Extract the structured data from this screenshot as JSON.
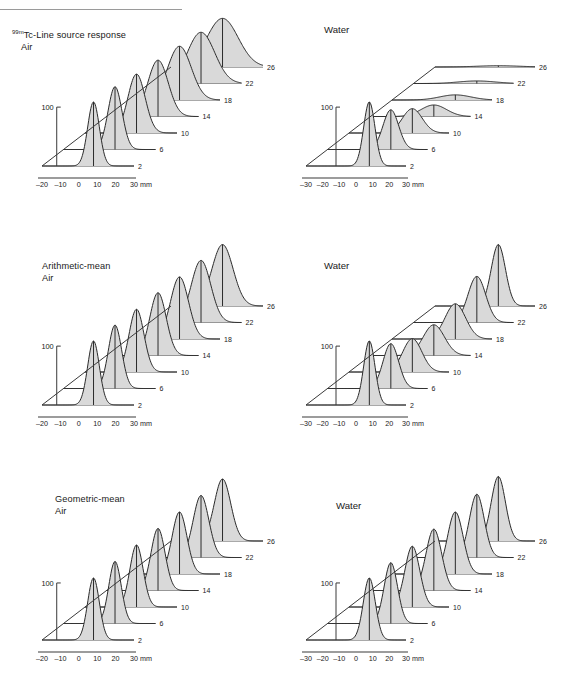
{
  "figure": {
    "title_main": "Tc-Line source response",
    "title_sup": "99m",
    "rows": [
      {
        "id": "row1",
        "label_line1": "Tc-Line source response",
        "label_line2": "Air",
        "has_sup": true
      },
      {
        "id": "row2",
        "label_line1": "Arithmetic-mean",
        "label_line2": "Air",
        "has_sup": false
      },
      {
        "id": "row3",
        "label_line1": "Geometric-mean",
        "label_line2": "Air",
        "has_sup": false
      }
    ],
    "right_column_title": "Water",
    "y_axis_label": "100",
    "x_unit": "mm",
    "x_ticks_air": [
      "-20",
      "-10",
      "0",
      "10",
      "20",
      "30"
    ],
    "x_ticks_water": [
      "-30",
      "-20",
      "-10",
      "0",
      "10",
      "20",
      "30"
    ],
    "depth_labels": [
      "2",
      "6",
      "10",
      "14",
      "18",
      "22",
      "26"
    ],
    "colors": {
      "fill": "#d9d9d9",
      "stroke": "#2b2b2b",
      "axis": "#3a3a3a",
      "rule": "#9a9a9a",
      "baseline": "#555555"
    }
  },
  "chart_data": {
    "type": "line",
    "title": "99mTc-Line source response",
    "xlabel": "mm",
    "ylabel": "100",
    "x": [
      -30,
      -20,
      -10,
      0,
      10,
      20,
      30
    ],
    "xlim_air": [
      -20,
      30
    ],
    "xlim_water": [
      -30,
      30
    ],
    "grid": false,
    "legend": "none",
    "depth_axis_label": "Depth (cm)",
    "depths": [
      2,
      6,
      10,
      14,
      18,
      22,
      26
    ],
    "panels": [
      {
        "row": "99mTc-Line source response",
        "medium": "Air",
        "series": [
          {
            "name": "2",
            "peak": 100,
            "fwhm": 7.5
          },
          {
            "name": "6",
            "peak": 98,
            "fwhm": 9.0
          },
          {
            "name": "10",
            "peak": 92,
            "fwhm": 11.0
          },
          {
            "name": "14",
            "peak": 88,
            "fwhm": 13.0
          },
          {
            "name": "18",
            "peak": 84,
            "fwhm": 15.0
          },
          {
            "name": "22",
            "peak": 80,
            "fwhm": 17.5
          },
          {
            "name": "26",
            "peak": 76,
            "fwhm": 20.0
          }
        ]
      },
      {
        "row": "99mTc-Line source response",
        "medium": "Water",
        "series": [
          {
            "name": "2",
            "peak": 100,
            "fwhm": 8.0
          },
          {
            "name": "6",
            "peak": 62,
            "fwhm": 11.0
          },
          {
            "name": "10",
            "peak": 38,
            "fwhm": 14.0
          },
          {
            "name": "14",
            "peak": 18,
            "fwhm": 18.0
          },
          {
            "name": "18",
            "peak": 8,
            "fwhm": 22.0
          },
          {
            "name": "22",
            "peak": 4,
            "fwhm": 26.0
          },
          {
            "name": "26",
            "peak": 2,
            "fwhm": 30.0
          }
        ]
      },
      {
        "row": "Arithmetic-mean",
        "medium": "Air",
        "series": [
          {
            "name": "2",
            "peak": 100,
            "fwhm": 7.5
          },
          {
            "name": "6",
            "peak": 99,
            "fwhm": 8.5
          },
          {
            "name": "10",
            "peak": 98,
            "fwhm": 9.5
          },
          {
            "name": "14",
            "peak": 98,
            "fwhm": 10.5
          },
          {
            "name": "18",
            "peak": 97,
            "fwhm": 11.5
          },
          {
            "name": "22",
            "peak": 97,
            "fwhm": 12.5
          },
          {
            "name": "26",
            "peak": 96,
            "fwhm": 13.5
          }
        ]
      },
      {
        "row": "Arithmetic-mean",
        "medium": "Water",
        "series": [
          {
            "name": "2",
            "peak": 100,
            "fwhm": 8.0
          },
          {
            "name": "6",
            "peak": 70,
            "fwhm": 11.0
          },
          {
            "name": "10",
            "peak": 52,
            "fwhm": 13.5
          },
          {
            "name": "14",
            "peak": 48,
            "fwhm": 15.0
          },
          {
            "name": "18",
            "peak": 55,
            "fwhm": 14.5
          },
          {
            "name": "22",
            "peak": 72,
            "fwhm": 12.5
          },
          {
            "name": "26",
            "peak": 96,
            "fwhm": 10.0
          }
        ]
      },
      {
        "row": "Geometric-mean",
        "medium": "Air",
        "series": [
          {
            "name": "2",
            "peak": 100,
            "fwhm": 7.5
          },
          {
            "name": "6",
            "peak": 100,
            "fwhm": 8.0
          },
          {
            "name": "10",
            "peak": 100,
            "fwhm": 8.5
          },
          {
            "name": "14",
            "peak": 100,
            "fwhm": 9.0
          },
          {
            "name": "18",
            "peak": 100,
            "fwhm": 9.5
          },
          {
            "name": "22",
            "peak": 100,
            "fwhm": 10.0
          },
          {
            "name": "26",
            "peak": 100,
            "fwhm": 10.5
          }
        ]
      },
      {
        "row": "Geometric-mean",
        "medium": "Water",
        "series": [
          {
            "name": "2",
            "peak": 100,
            "fwhm": 8.5
          },
          {
            "name": "6",
            "peak": 98,
            "fwhm": 9.5
          },
          {
            "name": "10",
            "peak": 98,
            "fwhm": 10.5
          },
          {
            "name": "14",
            "peak": 99,
            "fwhm": 11.0
          },
          {
            "name": "18",
            "peak": 100,
            "fwhm": 11.0
          },
          {
            "name": "22",
            "peak": 102,
            "fwhm": 10.5
          },
          {
            "name": "26",
            "peak": 104,
            "fwhm": 10.0
          }
        ]
      }
    ]
  }
}
